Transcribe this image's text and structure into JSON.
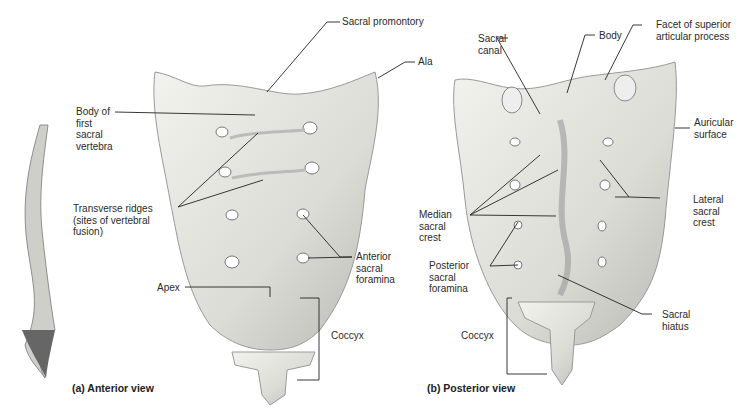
{
  "figure": {
    "panels": [
      {
        "id": "a",
        "caption": "(a) Anterior view",
        "labels": {
          "sacral_promontory": "Sacral promontory",
          "ala": "Ala",
          "body_first_sacral": "Body of\nfirst\nsacral\nvertebra",
          "transverse_ridges": "Transverse ridges\n(sites of vertebral\nfusion)",
          "anterior_sacral_foramina": "Anterior\nsacral\nforamina",
          "apex": "Apex",
          "coccyx": "Coccyx"
        }
      },
      {
        "id": "b",
        "caption": "(b) Posterior view",
        "labels": {
          "sacral_canal": "Sacral\ncanal",
          "body": "Body",
          "facet_superior": "Facet of superior\narticular process",
          "auricular_surface": "Auricular\nsurface",
          "lateral_sacral_crest": "Lateral\nsacral\ncrest",
          "median_sacral_crest": "Median\nsacral\ncrest",
          "posterior_sacral_foramina": "Posterior\nsacral\nforamina",
          "sacral_hiatus": "Sacral\nhiatus",
          "coccyx": "Coccyx"
        }
      }
    ]
  },
  "colors": {
    "bone": "#e9e9e4",
    "bone_shadow": "#a8a8a2",
    "line": "#222222"
  }
}
